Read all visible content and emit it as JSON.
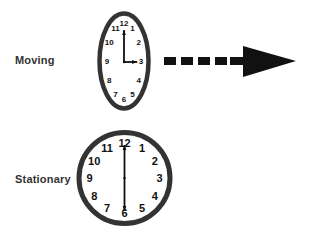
{
  "labels": {
    "moving": "Moving",
    "stationary": "Stationary"
  },
  "clocks": {
    "moving": {
      "numerals": [
        "12",
        "1",
        "2",
        "3",
        "4",
        "5",
        "6",
        "7",
        "8",
        "9",
        "10",
        "11"
      ],
      "time": {
        "hour": 3,
        "minute": 0
      },
      "shape": "ellipse (length-contracted)"
    },
    "stationary": {
      "numerals": [
        "12",
        "1",
        "2",
        "3",
        "4",
        "5",
        "6",
        "7",
        "8",
        "9",
        "10",
        "11"
      ],
      "time": {
        "hour": 6,
        "minute": 0
      },
      "shape": "circle"
    }
  },
  "arrow": {
    "style": "dashed",
    "direction": "right",
    "dash_count": 5
  },
  "colors": {
    "ink": "#111111",
    "rim": "#333333",
    "background": "#ffffff"
  }
}
